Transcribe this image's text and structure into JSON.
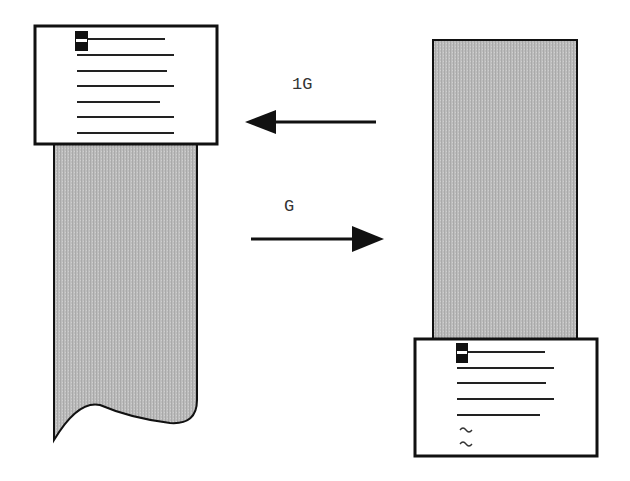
{
  "diagram": {
    "left_figure": {
      "meaning": "screen showing top of file, cursor on first line",
      "screen_lines": 7,
      "cursor_line": 1
    },
    "right_figure": {
      "meaning": "screen showing end of file, cursor on last line with tilde empty lines",
      "screen_lines": 5,
      "cursor_line": 1,
      "tilde_lines": [
        "~",
        "~"
      ]
    },
    "arrows": [
      {
        "label": "1G",
        "direction": "left"
      },
      {
        "label": "G",
        "direction": "right"
      }
    ],
    "colors": {
      "strip_fill": "#b8b8b8",
      "outline": "#111111",
      "screen_fill": "#ffffff",
      "cursor": "#111111"
    }
  }
}
